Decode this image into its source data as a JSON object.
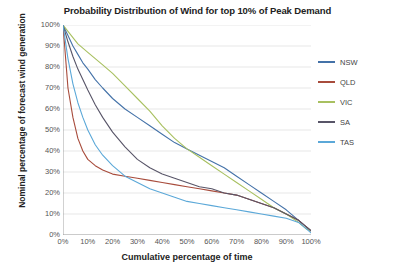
{
  "chart_data": {
    "type": "line",
    "title": "Probability Distribution of Wind for top 10% of Peak Demand",
    "xlabel": "Cumulative percentage of time",
    "ylabel": "Nominal percentage of forecast wind generation",
    "xlim": [
      0,
      100
    ],
    "ylim": [
      0,
      100
    ],
    "grid": "horizontal",
    "legend_position": "right",
    "xticks": [
      "0%",
      "10%",
      "20%",
      "30%",
      "40%",
      "50%",
      "60%",
      "70%",
      "80%",
      "90%",
      "100%"
    ],
    "yticks": [
      "0%",
      "10%",
      "20%",
      "30%",
      "40%",
      "50%",
      "60%",
      "70%",
      "80%",
      "90%",
      "100%"
    ],
    "x": [
      0,
      2,
      4,
      6,
      8,
      10,
      13,
      16,
      20,
      25,
      30,
      35,
      40,
      45,
      50,
      55,
      60,
      65,
      70,
      75,
      80,
      85,
      90,
      95,
      98,
      100
    ],
    "series": [
      {
        "name": "NSW",
        "color": "#4472A8",
        "values": [
          100,
          95,
          90,
          86,
          82,
          79,
          74,
          70,
          65,
          60,
          56,
          52,
          48,
          44,
          41,
          38,
          35,
          32,
          28,
          24,
          20,
          16,
          12,
          7,
          4,
          2
        ]
      },
      {
        "name": "QLD",
        "color": "#A84C3C",
        "values": [
          100,
          70,
          56,
          46,
          40,
          36,
          33,
          31,
          29,
          28,
          27,
          26,
          25,
          24,
          23,
          22,
          21,
          20,
          19,
          17,
          15,
          13,
          10,
          7,
          4,
          2
        ]
      },
      {
        "name": "VIC",
        "color": "#A8C060",
        "values": [
          100,
          97,
          94,
          91,
          89,
          87,
          84,
          81,
          77,
          71,
          65,
          59,
          52,
          46,
          41,
          37,
          33,
          29,
          25,
          21,
          17,
          13,
          10,
          6,
          3,
          2
        ]
      },
      {
        "name": "SA",
        "color": "#585568",
        "values": [
          100,
          92,
          85,
          79,
          74,
          69,
          62,
          56,
          49,
          42,
          36,
          32,
          29,
          27,
          25,
          23,
          22,
          20,
          19,
          17,
          15,
          13,
          10,
          7,
          4,
          2
        ]
      },
      {
        "name": "TAS",
        "color": "#5BA8D8",
        "values": [
          100,
          84,
          72,
          63,
          56,
          50,
          43,
          38,
          33,
          28,
          25,
          22,
          20,
          18,
          16,
          15,
          14,
          13,
          12,
          11,
          10,
          9,
          8,
          6,
          3,
          1
        ]
      }
    ]
  },
  "legend": {
    "items": [
      {
        "label": "NSW",
        "color": "#4472A8"
      },
      {
        "label": "QLD",
        "color": "#A84C3C"
      },
      {
        "label": "VIC",
        "color": "#A8C060"
      },
      {
        "label": "SA",
        "color": "#585568"
      },
      {
        "label": "TAS",
        "color": "#5BA8D8"
      }
    ]
  }
}
